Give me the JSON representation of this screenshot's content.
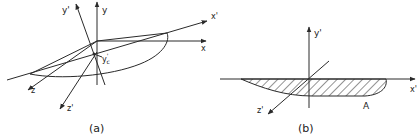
{
  "figure_a": {
    "caption": "(a)",
    "labels": {
      "y": "y",
      "y_prime": "y'",
      "x": "x",
      "x_prime": "x'",
      "z": "z",
      "z_prime": "z'",
      "yc_prime": "y'c"
    }
  },
  "figure_b": {
    "caption": "(b)",
    "labels": {
      "y_prime": "y'",
      "x_prime": "x'",
      "z_prime": "z'",
      "area": "A"
    }
  },
  "colors": {
    "line": "#2a2a2a",
    "background": "#ffffff"
  }
}
